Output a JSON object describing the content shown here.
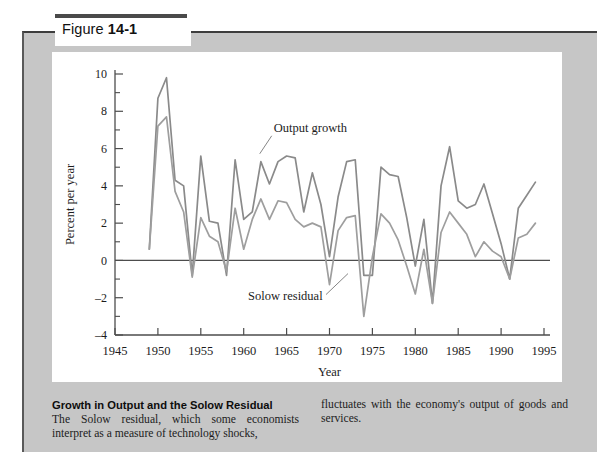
{
  "figure": {
    "prefix": "Figure",
    "number": "14-1"
  },
  "caption": {
    "title": "Growth in Output and the Solow Residual",
    "body_left": "The Solow residual, which some economists interpret as a measure of technology shocks,",
    "body_right": "fluctuates with the economy's output of goods and services."
  },
  "colors": {
    "panel_gray": "#c6c6c6",
    "plate_white": "#ffffff",
    "axis": "#4d4d4d",
    "output_growth_line": "#8a8a8a",
    "solow_residual_line": "#9e9e9e",
    "text": "#1c1c1c"
  },
  "chart_data": {
    "type": "line",
    "title": "",
    "xlabel": "Year",
    "ylabel": "Percent per year",
    "xlim": [
      1945,
      1995
    ],
    "ylim": [
      -4,
      10
    ],
    "xticks": [
      1945,
      1950,
      1955,
      1960,
      1965,
      1970,
      1975,
      1980,
      1985,
      1990,
      1995
    ],
    "yticks": [
      -4,
      -2,
      0,
      2,
      4,
      6,
      8,
      10
    ],
    "yticks_minor": [
      -3,
      -1,
      1,
      3,
      5,
      7,
      9
    ],
    "grid": false,
    "zero_line": true,
    "legend_position": "inline-annotations",
    "x": [
      1949,
      1950,
      1951,
      1952,
      1953,
      1954,
      1955,
      1956,
      1957,
      1958,
      1959,
      1960,
      1961,
      1962,
      1963,
      1964,
      1965,
      1966,
      1967,
      1968,
      1969,
      1970,
      1971,
      1972,
      1973,
      1974,
      1975,
      1976,
      1977,
      1978,
      1979,
      1980,
      1981,
      1982,
      1983,
      1984,
      1985,
      1986,
      1987,
      1988,
      1989,
      1990,
      1991,
      1992,
      1993,
      1994
    ],
    "series": [
      {
        "name": "Output growth",
        "label": "Output growth",
        "color": "#8a8a8a",
        "values": [
          0.6,
          8.7,
          9.8,
          4.3,
          4.0,
          -0.8,
          5.6,
          2.1,
          2.0,
          -0.8,
          5.4,
          2.2,
          2.6,
          5.3,
          4.1,
          5.3,
          5.6,
          5.5,
          2.6,
          4.7,
          3.0,
          0.2,
          3.4,
          5.3,
          5.4,
          -0.8,
          -0.8,
          5.0,
          4.6,
          4.5,
          2.3,
          -0.3,
          2.2,
          -2.3,
          4.0,
          6.1,
          3.2,
          2.8,
          3.0,
          4.1,
          2.5,
          0.9,
          -1.0,
          2.8,
          3.5,
          4.2
        ]
      },
      {
        "name": "Solow residual",
        "label": "Solow residual",
        "color": "#9e9e9e",
        "values": [
          0.6,
          7.2,
          7.7,
          3.7,
          2.6,
          -0.9,
          2.3,
          1.3,
          1.0,
          -0.6,
          2.8,
          0.6,
          2.2,
          3.3,
          2.2,
          3.2,
          3.1,
          2.2,
          1.8,
          2.0,
          1.8,
          -1.3,
          1.6,
          2.3,
          2.4,
          -3.0,
          0.2,
          2.5,
          2.0,
          1.1,
          -0.3,
          -1.8,
          0.6,
          -2.3,
          1.5,
          2.6,
          2.0,
          1.4,
          0.2,
          1.0,
          0.5,
          0.2,
          -1.0,
          1.2,
          1.4,
          2.0
        ]
      }
    ],
    "annotations": [
      {
        "text": "Output growth",
        "x": 1963.5,
        "y": 6.9
      },
      {
        "text": "Solow residual",
        "x": 1960.5,
        "y": -2.1
      }
    ]
  }
}
